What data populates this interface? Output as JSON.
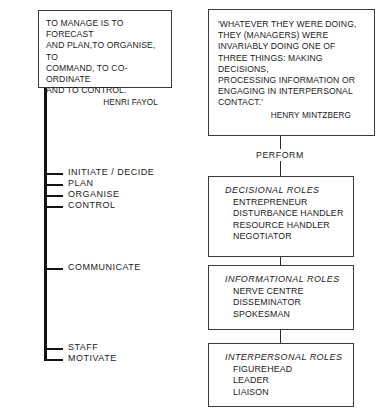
{
  "diagram": {
    "background_color": "#ffffff",
    "line_color": "#141414",
    "box_border_color": "#3a3a3a"
  },
  "fayol_quote": {
    "text": "TO MANAGE IS TO FORECAST\nAND PLAN,TO ORGANISE, TO\nCOMMAND, TO CO-ORDINATE\nAND TO CONTROL.",
    "attribution": "HENRI FAYOL"
  },
  "mintzberg_quote": {
    "text": "'WHATEVER THEY WERE DOING,\nTHEY (MANAGERS) WERE\nINVARIABLY DOING ONE OF\nTHREE THINGS: MAKING DECISIONS,\nPROCESSING INFORMATION OR\nENGAGING IN INTERPERSONAL\nCONTACT.'",
    "attribution": "HENRY MINTZBERG"
  },
  "connector": {
    "perform_label": "PERFORM"
  },
  "functions": [
    {
      "label": "INITIATE / DECIDE",
      "top": 173
    },
    {
      "label": "PLAN",
      "top": 184
    },
    {
      "label": "ORGANISE",
      "top": 195
    },
    {
      "label": "CONTROL",
      "top": 206
    },
    {
      "label": "COMMUNICATE",
      "top": 268
    },
    {
      "label": "STAFF",
      "top": 348
    },
    {
      "label": "MOTIVATE",
      "top": 359
    }
  ],
  "role_groups": [
    {
      "title": "DECISIONAL ROLES",
      "items": [
        "ENTREPRENEUR",
        "DISTURBANCE HANDLER",
        "RESOURCE HANDLER",
        "NEGOTIATOR"
      ]
    },
    {
      "title": "INFORMATIONAL ROLES",
      "items": [
        "NERVE CENTRE",
        "DISSEMINATOR",
        "SPOKESMAN"
      ]
    },
    {
      "title": "INTERPERSONAL ROLES",
      "items": [
        "FIGUREHEAD",
        "LEADER",
        "LIAISON"
      ]
    }
  ]
}
